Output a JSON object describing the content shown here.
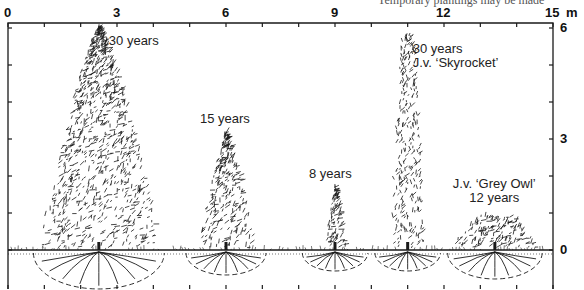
{
  "caption_fragment": "Temporary plantings may be made",
  "x_axis": {
    "unit": "m",
    "ticks": [
      "0",
      "3",
      "6",
      "9",
      "12",
      "15"
    ],
    "minor_step": 1
  },
  "y_axis": {
    "ticks": [
      "6",
      "3",
      "0"
    ]
  },
  "plants": [
    {
      "id": "juniper-30",
      "label_lines": [
        "30 years"
      ],
      "x_m": 2.5,
      "height_m": 6.0,
      "half_width_m": 1.6,
      "shape": "broad-cone",
      "root_radius_m": 1.8
    },
    {
      "id": "juniper-15",
      "label_lines": [
        "15 years"
      ],
      "x_m": 6.0,
      "height_m": 3.2,
      "half_width_m": 0.8,
      "shape": "cone",
      "root_radius_m": 1.1
    },
    {
      "id": "juniper-8",
      "label_lines": [
        "8 years"
      ],
      "x_m": 9.0,
      "height_m": 1.7,
      "half_width_m": 0.3,
      "shape": "cone",
      "root_radius_m": 0.9
    },
    {
      "id": "skyrocket-30",
      "label_lines": [
        "30 years",
        "J.v. ‘Skyrocket’"
      ],
      "x_m": 11.0,
      "height_m": 5.8,
      "half_width_m": 0.45,
      "shape": "column",
      "root_radius_m": 0.9
    },
    {
      "id": "grey-owl-12",
      "label_lines": [
        "J.v. ‘Grey Owl’",
        "12 years"
      ],
      "x_m": 13.4,
      "height_m": 0.9,
      "half_width_m": 1.2,
      "shape": "spreading",
      "root_radius_m": 1.3
    }
  ],
  "colors": {
    "ink": "#1a1a1a",
    "paper": "#ffffff"
  }
}
